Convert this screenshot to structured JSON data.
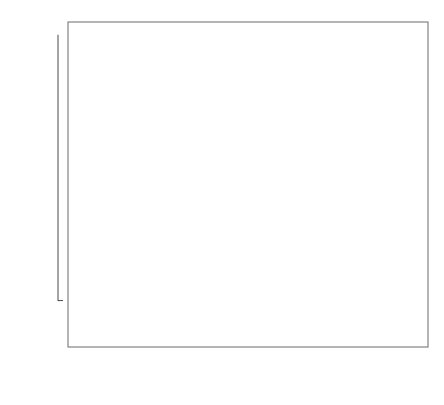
{
  "chart_data": {
    "type": "box",
    "title": "",
    "xlabel": "Year",
    "ylabel": "Energy per unit GDP",
    "xlim": [
      1989.4,
      2008.6
    ],
    "ylim": [
      60,
      1040
    ],
    "yticks": [
      200,
      400,
      600,
      800,
      1000
    ],
    "xticks": [
      1990,
      1992,
      1994,
      1996,
      1998,
      2000,
      2002,
      2004,
      2006,
      2008
    ],
    "grid": false,
    "legend_position": "top-left",
    "categories": [
      1990,
      1991,
      1992,
      1993,
      1994,
      1995,
      1996,
      1997,
      1998,
      1999,
      2000,
      2001,
      2002,
      2003,
      2004,
      2005,
      2006,
      2007,
      2008
    ],
    "series": [
      {
        "name": "EU-12",
        "color": "#e3e3e3",
        "years": [
          1990,
          1991,
          1992,
          1993,
          1994
        ]
      },
      {
        "name": "EU-15",
        "color": "#c2c2c2",
        "years": [
          1995,
          1996,
          1997,
          1998,
          1999,
          2000,
          2001,
          2002,
          2003
        ]
      },
      {
        "name": "EU-25",
        "color": "#8d8d8d",
        "years": [
          2004,
          2005,
          2006
        ]
      },
      {
        "name": "EU-27",
        "color": "#454545",
        "years": [
          2007,
          2008
        ]
      }
    ],
    "boxes": [
      {
        "year": 1990,
        "group": "EU-12",
        "lower_whisker": 97,
        "q1": 186,
        "median": 217,
        "q3": 252,
        "upper_whisker": 330,
        "outliers": []
      },
      {
        "year": 1991,
        "group": "EU-12",
        "lower_whisker": 97,
        "q1": 184,
        "median": 214,
        "q3": 250,
        "upper_whisker": 322,
        "outliers": []
      },
      {
        "year": 1992,
        "group": "EU-12",
        "lower_whisker": 96,
        "q1": 180,
        "median": 206,
        "q3": 246,
        "upper_whisker": 318,
        "outliers": []
      },
      {
        "year": 1993,
        "group": "EU-12",
        "lower_whisker": 95,
        "q1": 180,
        "median": 208,
        "q3": 244,
        "upper_whisker": 312,
        "outliers": []
      },
      {
        "year": 1994,
        "group": "EU-12",
        "lower_whisker": 96,
        "q1": 182,
        "median": 207,
        "q3": 252,
        "upper_whisker": 320,
        "outliers": []
      },
      {
        "year": 1995,
        "group": "EU-15",
        "lower_whisker": 96,
        "q1": 176,
        "median": 216,
        "q3": 238,
        "upper_whisker": 316,
        "outliers": [
          357
        ]
      },
      {
        "year": 1996,
        "group": "EU-15",
        "lower_whisker": 97,
        "q1": 186,
        "median": 218,
        "q3": 248,
        "upper_whisker": 330,
        "outliers": []
      },
      {
        "year": 1997,
        "group": "EU-15",
        "lower_whisker": 95,
        "q1": 180,
        "median": 205,
        "q3": 238,
        "upper_whisker": 318,
        "outliers": []
      },
      {
        "year": 1998,
        "group": "EU-15",
        "lower_whisker": 94,
        "q1": 178,
        "median": 200,
        "q3": 232,
        "upper_whisker": 300,
        "outliers": [
          335
        ]
      },
      {
        "year": 1999,
        "group": "EU-15",
        "lower_whisker": 92,
        "q1": 172,
        "median": 196,
        "q3": 226,
        "upper_whisker": 292,
        "outliers": [
          332
        ]
      },
      {
        "year": 2000,
        "group": "EU-15",
        "lower_whisker": 92,
        "q1": 168,
        "median": 190,
        "q3": 222,
        "upper_whisker": 272,
        "outliers": [
          334,
          347
        ]
      },
      {
        "year": 2001,
        "group": "EU-15",
        "lower_whisker": 93,
        "q1": 172,
        "median": 196,
        "q3": 226,
        "upper_whisker": 274,
        "outliers": [
          330,
          340
        ]
      },
      {
        "year": 2002,
        "group": "EU-15",
        "lower_whisker": 91,
        "q1": 168,
        "median": 190,
        "q3": 220,
        "upper_whisker": 268,
        "outliers": [
          330,
          344
        ]
      },
      {
        "year": 2003,
        "group": "EU-15",
        "lower_whisker": 92,
        "q1": 170,
        "median": 192,
        "q3": 226,
        "upper_whisker": 272,
        "outliers": [
          336
        ]
      },
      {
        "year": 2004,
        "group": "EU-25",
        "lower_whisker": 96,
        "q1": 136,
        "median": 216,
        "q3": 344,
        "upper_whisker": 552,
        "outliers": [
          612,
          644,
          660,
          734
        ]
      },
      {
        "year": 2005,
        "group": "EU-25",
        "lower_whisker": 94,
        "q1": 134,
        "median": 202,
        "q3": 330,
        "upper_whisker": 492,
        "outliers": [
          596,
          604,
          680
        ]
      },
      {
        "year": 2006,
        "group": "EU-25",
        "lower_whisker": 92,
        "q1": 130,
        "median": 190,
        "q3": 348,
        "upper_whisker": 548,
        "outliers": [
          566,
          600
        ]
      },
      {
        "year": 2007,
        "group": "EU-27",
        "lower_whisker": 92,
        "q1": 128,
        "median": 200,
        "q3": 396,
        "upper_whisker": 618,
        "outliers": [
          1005
        ]
      },
      {
        "year": 2008,
        "group": "EU-27",
        "lower_whisker": 90,
        "q1": 126,
        "median": 196,
        "q3": 382,
        "upper_whisker": 600,
        "outliers": [
          940
        ]
      }
    ]
  },
  "legend": {
    "items": [
      {
        "label": "EU-12",
        "color": "#e3e3e3"
      },
      {
        "label": "EU-15",
        "color": "#c2c2c2"
      },
      {
        "label": "EU-25",
        "color": "#8d8d8d"
      },
      {
        "label": "EU-27",
        "color": "#454545"
      }
    ]
  },
  "axes": {
    "y_title": "Energy per unit GDP",
    "x_title": "Year",
    "y_tick_labels": [
      "200",
      "400",
      "600",
      "800",
      "1000"
    ],
    "x_tick_labels": [
      "1990",
      "1992",
      "1994",
      "1996",
      "1998",
      "2000",
      "2002",
      "2004",
      "2006",
      "2008"
    ]
  }
}
